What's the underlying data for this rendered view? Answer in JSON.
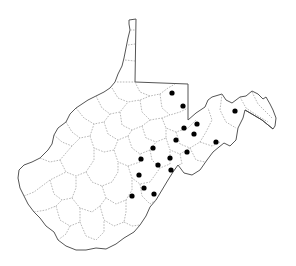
{
  "map": {
    "region": "West Virginia",
    "subdivision": "counties",
    "background_color": "#ffffff",
    "outline_color": "#555555",
    "county_line_color": "#9a9a9a",
    "marker_color": "#000000",
    "marker_radius": 2.6,
    "markers": [
      {
        "x": 172,
        "y": 93
      },
      {
        "x": 183,
        "y": 106
      },
      {
        "x": 235,
        "y": 111
      },
      {
        "x": 197,
        "y": 124
      },
      {
        "x": 184,
        "y": 128
      },
      {
        "x": 194,
        "y": 134
      },
      {
        "x": 176,
        "y": 140
      },
      {
        "x": 216,
        "y": 142
      },
      {
        "x": 153,
        "y": 148
      },
      {
        "x": 187,
        "y": 152
      },
      {
        "x": 141,
        "y": 159
      },
      {
        "x": 170,
        "y": 158
      },
      {
        "x": 158,
        "y": 165
      },
      {
        "x": 171,
        "y": 170
      },
      {
        "x": 139,
        "y": 175
      },
      {
        "x": 144,
        "y": 188
      },
      {
        "x": 154,
        "y": 194
      },
      {
        "x": 132,
        "y": 196
      }
    ]
  }
}
